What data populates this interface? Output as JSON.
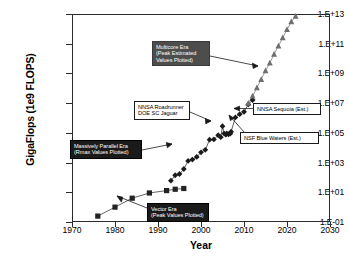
{
  "chart_data": {
    "type": "scatter",
    "title": "",
    "xlabel": "Year",
    "ylabel": "GigaFlops (1e9 FLOPS)",
    "xlim": [
      1970,
      2030
    ],
    "ylim": [
      0.1,
      10000000000000.0
    ],
    "yscale": "log",
    "grid": false,
    "legend": "none",
    "xticks": [
      "1970",
      "1980",
      "1990",
      "2000",
      "2010",
      "2020",
      "2030"
    ],
    "yticks": [
      "1.E-01",
      "1.E+01",
      "1.E+03",
      "1.E+05",
      "1.E+07",
      "1.E+09",
      "1.E+11",
      "1.E+13"
    ],
    "series": [
      {
        "name": "Vector Era (Peak Values Plotted)",
        "marker": "square",
        "color": "#222222",
        "points": [
          [
            1976,
            0.25
          ],
          [
            1980,
            1.0
          ],
          [
            1984,
            4.0
          ],
          [
            1988,
            9.0
          ],
          [
            1992,
            13.0
          ],
          [
            1994,
            16.0
          ],
          [
            1996,
            18.0
          ]
        ]
      },
      {
        "name": "Massively Parallel Era (Rmax Values Plotted)",
        "marker": "diamond",
        "color": "#1a1a1a",
        "points": [
          [
            1993,
            60
          ],
          [
            1994,
            140
          ],
          [
            1995,
            170
          ],
          [
            1996,
            370
          ],
          [
            1997,
            1300
          ],
          [
            1998,
            1600
          ],
          [
            1999,
            2400
          ],
          [
            2000,
            4900
          ],
          [
            2001,
            7200
          ],
          [
            2002,
            35000
          ],
          [
            2003,
            36000
          ],
          [
            2004,
            70000
          ],
          [
            2004.6,
            51000
          ],
          [
            2005,
            280000
          ],
          [
            2005.4,
            90000
          ],
          [
            2005.8,
            75000
          ],
          [
            2006,
            92000
          ],
          [
            2006.4,
            80000
          ],
          [
            2006.8,
            88000
          ],
          [
            2007,
            120000
          ],
          [
            2008,
            1100000
          ],
          [
            2009,
            1800000
          ],
          [
            2010,
            2600000
          ],
          [
            2011,
            8200000
          ],
          [
            2012,
            16000000
          ]
        ]
      },
      {
        "name": "Multicore Era (Peak Estimated Values Plotted)",
        "marker": "triangle",
        "color": "#6e6e6e",
        "points": [
          [
            2011,
            10000000.0
          ],
          [
            2012,
            30000000.0
          ],
          [
            2013,
            110000000.0
          ],
          [
            2014,
            400000000.0
          ],
          [
            2015,
            1500000000.0
          ],
          [
            2016,
            5000000000.0
          ],
          [
            2017,
            20000000000.0
          ],
          [
            2018,
            70000000000.0
          ],
          [
            2019,
            250000000000.0
          ],
          [
            2020,
            900000000000.0
          ],
          [
            2021,
            3000000000000.0
          ],
          [
            2022,
            7000000000000.0
          ]
        ]
      }
    ],
    "annotations": [
      {
        "id": "multicore",
        "text": "Multicore Era\n(Peak Estimated\nValues Plotted)",
        "style": "dark"
      },
      {
        "id": "massively",
        "text": "Massively Parallel Era\n(Rmax Values Plotted)",
        "style": "black"
      },
      {
        "id": "roadrunner",
        "text": "NNSA Roadrunner\nDOE SC Jaguar",
        "style": "light"
      },
      {
        "id": "sequoia",
        "text": "NNSA Sequoia (Est.)",
        "style": "light"
      },
      {
        "id": "bluewaters",
        "text": "NSF Blue Waters (Est.)",
        "style": "light"
      },
      {
        "id": "vector",
        "text": "Vector Era\n(Peak Values Plotted)",
        "style": "black"
      }
    ],
    "colors": {
      "axis": "#2b2b2b",
      "vector_marker": "#222222",
      "parallel_marker": "#1a1a1a",
      "multicore_marker": "#6e6e6e",
      "anno_dark": "#4d4d4d",
      "anno_black": "#1a1a1a",
      "anno_light_bg": "#ffffff"
    }
  }
}
